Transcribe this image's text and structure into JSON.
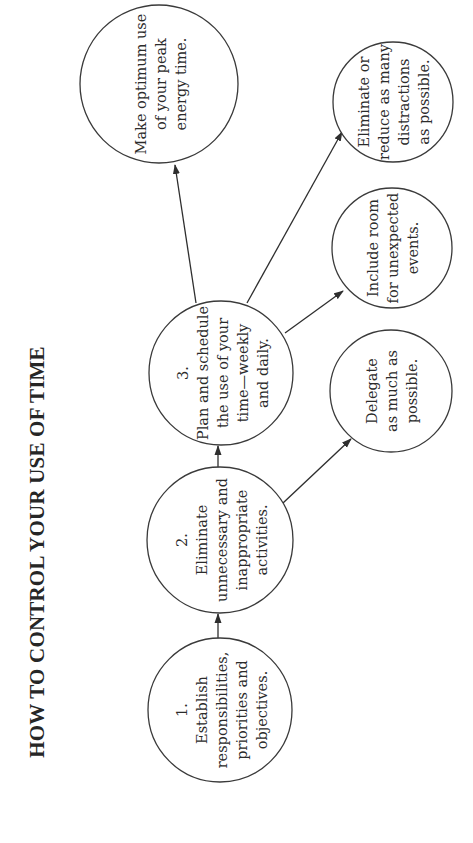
{
  "title": "HOW TO CONTROL YOUR USE OF TIME",
  "colors": {
    "background": "#ffffff",
    "stroke": "#3a3a3a",
    "text": "#2b2b2b"
  },
  "nodes": {
    "step1": {
      "number": "1.",
      "lines": [
        "Establish",
        "responsibilities,",
        "priorities and",
        "objectives."
      ]
    },
    "step2": {
      "number": "2.",
      "lines": [
        "Eliminate",
        "unnecessary and",
        "inappropriate",
        "activities."
      ]
    },
    "step3": {
      "number": "3.",
      "lines": [
        "Plan and schedule",
        "the use of your",
        "time—weekly",
        "and daily."
      ]
    },
    "peak_energy": {
      "lines": [
        "Make optimum use",
        "of your peak",
        "energy time."
      ]
    },
    "distractions": {
      "lines": [
        "Eliminate or",
        "reduce as many",
        "distractions",
        "as possible."
      ]
    },
    "unexpected": {
      "lines": [
        "Include room",
        "for unexpected",
        "events."
      ]
    },
    "delegate": {
      "lines": [
        "Delegate",
        "as much as",
        "possible."
      ]
    }
  },
  "edges": [
    {
      "from": "step1",
      "to": "step2"
    },
    {
      "from": "step2",
      "to": "step3"
    },
    {
      "from": "step2",
      "to": "delegate"
    },
    {
      "from": "step3",
      "to": "peak_energy"
    },
    {
      "from": "step3",
      "to": "distractions"
    },
    {
      "from": "step3",
      "to": "unexpected"
    }
  ]
}
